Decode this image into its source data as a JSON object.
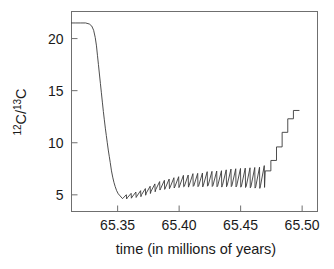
{
  "chart_data": {
    "type": "line",
    "title": "",
    "xlabel": "time (in millions of years)",
    "ylabel": "12C/13C",
    "ylabel_parts": {
      "sup1": "12",
      "base1": "C/",
      "sup2": "13",
      "base2": "C"
    },
    "xlim": [
      65.3125,
      65.5125
    ],
    "ylim": [
      3.4,
      22.6
    ],
    "xticks": [
      65.35,
      65.4,
      65.45,
      65.5
    ],
    "xtick_labels": [
      "65.35",
      "65.40",
      "65.45",
      "65.50"
    ],
    "yticks": [
      5,
      10,
      15,
      20
    ],
    "ytick_labels": [
      "5",
      "10",
      "15",
      "20"
    ],
    "grid": false,
    "legend": null,
    "line_color": "#3a3a3a",
    "axis_color": "#6f6f6f",
    "background": "#ffffff",
    "series": [
      {
        "name": "12C/13C",
        "x": [
          65.3125,
          65.316,
          65.32,
          65.324,
          65.327,
          65.329,
          65.3305,
          65.3318,
          65.3328,
          65.3336,
          65.3344,
          65.3352,
          65.336,
          65.3368,
          65.3376,
          65.3384,
          65.3392,
          65.34,
          65.3408,
          65.3416,
          65.3424,
          65.3432,
          65.344,
          65.345,
          65.346,
          65.347,
          65.348,
          65.3492,
          65.3505,
          65.352,
          65.354,
          65.356,
          65.358,
          65.36,
          65.362,
          65.364,
          65.366,
          65.368,
          65.37,
          65.372,
          65.374,
          65.376,
          65.378,
          65.38,
          65.382,
          65.384,
          65.386,
          65.388,
          65.39,
          65.392,
          65.394,
          65.396,
          65.398,
          65.4,
          65.402,
          65.404,
          65.406,
          65.408,
          65.41,
          65.412,
          65.414,
          65.416,
          65.418,
          65.42,
          65.422,
          65.424,
          65.426,
          65.428,
          65.43,
          65.432,
          65.434,
          65.436,
          65.438,
          65.44,
          65.442,
          65.444,
          65.446,
          65.448,
          65.45,
          65.452,
          65.454,
          65.456,
          65.458,
          65.46,
          65.462,
          65.464,
          65.466,
          65.468,
          65.47,
          65.472,
          65.474,
          65.476,
          65.478,
          65.48,
          65.482,
          65.484,
          65.486,
          65.488,
          65.49,
          65.492,
          65.494,
          65.496,
          65.4975
        ],
        "y": [
          21.5,
          21.5,
          21.5,
          21.5,
          21.4,
          21.2,
          20.8,
          20.1,
          19.3,
          18.4,
          17.5,
          16.6,
          15.7,
          14.8,
          13.9,
          13.0,
          12.2,
          11.4,
          10.7,
          10.0,
          9.3,
          8.7,
          8.1,
          7.3,
          6.7,
          6.2,
          5.8,
          5.4,
          5.1,
          4.9,
          4.8,
          4.8,
          4.9,
          4.9,
          5.0,
          5.0,
          5.1,
          5.1,
          5.2,
          5.3,
          5.4,
          5.5,
          5.6,
          5.7,
          5.8,
          5.9,
          5.9,
          6.0,
          6.0,
          6.1,
          6.1,
          6.2,
          6.2,
          6.2,
          6.3,
          6.3,
          6.3,
          6.3,
          6.4,
          6.4,
          6.4,
          6.4,
          6.4,
          6.5,
          6.5,
          6.5,
          6.5,
          6.5,
          6.5,
          6.5,
          6.5,
          6.5,
          6.6,
          6.6,
          6.6,
          6.6,
          6.6,
          6.6,
          6.6,
          6.6,
          6.6,
          6.6,
          6.6,
          6.6,
          6.6,
          6.6,
          6.6,
          6.7,
          7.3,
          7.3,
          8.3,
          8.3,
          8.3,
          9.6,
          9.6,
          11.0,
          11.0,
          11.0,
          12.3,
          12.3,
          13.1,
          13.1,
          13.1
        ],
        "oscillation": {
          "present": true,
          "start_x": 65.354,
          "end_x": 65.47,
          "shape": "sawtooth",
          "cycles": 30,
          "trough_range": [
            4.6,
            5.3
          ],
          "peak_range": [
            5.0,
            6.7
          ],
          "note": "Slow rise then abrupt drop each cycle; amplitude grows left to right."
        },
        "staircase": {
          "present": true,
          "start_x": 65.47,
          "end_x": 65.4975,
          "levels": [
            7.3,
            8.3,
            9.6,
            11.0,
            12.3,
            13.1
          ]
        }
      }
    ]
  }
}
